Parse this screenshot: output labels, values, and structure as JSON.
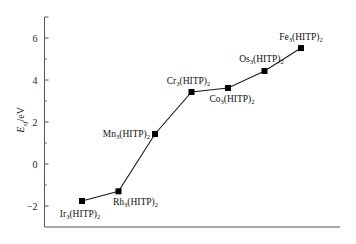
{
  "chart_data": {
    "type": "line",
    "title": "",
    "xlabel": "",
    "ylabel": "E_xf/eV",
    "ylabel_main": "E",
    "ylabel_sub": "xf",
    "ylabel_unit": "/eV",
    "ylim": [
      -3,
      7
    ],
    "yticks": [
      -2,
      0,
      2,
      4,
      6
    ],
    "yticks_minor": [
      -3,
      -1,
      1,
      3,
      5
    ],
    "grid": false,
    "legend": null,
    "marker": "square",
    "line_color": "#1a1a1a",
    "categories": [
      "Ir3(HITP)2",
      "Rh3(HITP)2",
      "Mn3(HITP)2",
      "Cr3(HITP)2",
      "Co3(HITP)2",
      "Os3(HITP)2",
      "Fe3(HITP)2"
    ],
    "series": [
      {
        "name": "E_xf",
        "values": [
          -1.76,
          -1.3,
          1.43,
          3.43,
          3.62,
          4.43,
          5.52
        ]
      }
    ],
    "point_labels": [
      {
        "metal": "Ir",
        "sub1": "3",
        "ligand": "(HITP)",
        "sub2": "2",
        "position": "below"
      },
      {
        "metal": "Rh",
        "sub1": "3",
        "ligand": "(HITP)",
        "sub2": "2",
        "position": "below-right"
      },
      {
        "metal": "Mn",
        "sub1": "3",
        "ligand": "(HITP)",
        "sub2": "2",
        "position": "left"
      },
      {
        "metal": "Cr",
        "sub1": "3",
        "ligand": "(HITP)",
        "sub2": "2",
        "position": "above"
      },
      {
        "metal": "Co",
        "sub1": "3",
        "ligand": "(HITP)",
        "sub2": "2",
        "position": "below"
      },
      {
        "metal": "Os",
        "sub1": "3",
        "ligand": "(HITP)",
        "sub2": "2",
        "position": "above-left"
      },
      {
        "metal": "Fe",
        "sub1": "3",
        "ligand": "(HITP)",
        "sub2": "2",
        "position": "above"
      }
    ]
  }
}
